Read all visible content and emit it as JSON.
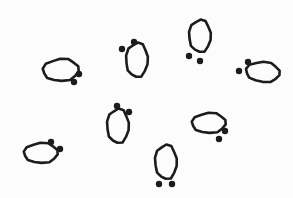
{
  "canvas": {
    "width": 293,
    "height": 198,
    "background_color": "#fcfcfc",
    "ink_color": "#1c1c1c",
    "stroke_width": 2.6,
    "description": "Line drawing of eight footprint-like glyphs scattered on a blank background"
  },
  "glyphs": [
    {
      "id": "glyph-1",
      "name": "footprint-upper-left",
      "orientation": "horizontal",
      "oval": {
        "cx": 61,
        "cy": 70,
        "rx": 18,
        "ry": 11,
        "rotation": -4
      },
      "dots": [
        {
          "cx": 79,
          "cy": 74,
          "r": 3.2
        },
        {
          "cx": 74,
          "cy": 82,
          "r": 3.2
        }
      ],
      "dot_placement": "lower-right"
    },
    {
      "id": "glyph-2",
      "name": "footprint-top-center-left",
      "orientation": "vertical",
      "oval": {
        "cx": 137,
        "cy": 60,
        "rx": 11,
        "ry": 17,
        "rotation": 3
      },
      "dots": [
        {
          "cx": 134,
          "cy": 42,
          "r": 3.2
        },
        {
          "cx": 122,
          "cy": 49,
          "r": 3.2
        }
      ],
      "dot_placement": "upper-left"
    },
    {
      "id": "glyph-3",
      "name": "footprint-top-right",
      "orientation": "vertical",
      "oval": {
        "cx": 200,
        "cy": 36,
        "rx": 11,
        "ry": 16,
        "rotation": 2
      },
      "dots": [
        {
          "cx": 189,
          "cy": 56,
          "r": 3.2
        },
        {
          "cx": 200,
          "cy": 61,
          "r": 3.2
        }
      ],
      "dot_placement": "below-left"
    },
    {
      "id": "glyph-4",
      "name": "footprint-right",
      "orientation": "horizontal",
      "oval": {
        "cx": 263,
        "cy": 72,
        "rx": 17,
        "ry": 10,
        "rotation": 3
      },
      "dots": [
        {
          "cx": 248,
          "cy": 62,
          "r": 3.2
        },
        {
          "cx": 239,
          "cy": 71,
          "r": 3.2
        }
      ],
      "dot_placement": "upper-left"
    },
    {
      "id": "glyph-5",
      "name": "footprint-center",
      "orientation": "vertical",
      "oval": {
        "cx": 118,
        "cy": 126,
        "rx": 11,
        "ry": 17,
        "rotation": 2
      },
      "dots": [
        {
          "cx": 117,
          "cy": 106,
          "r": 3.2
        },
        {
          "cx": 129,
          "cy": 112,
          "r": 3.2
        }
      ],
      "dot_placement": "above-right"
    },
    {
      "id": "glyph-6",
      "name": "footprint-lower-left",
      "orientation": "horizontal",
      "oval": {
        "cx": 41,
        "cy": 153,
        "rx": 17,
        "ry": 10,
        "rotation": -3
      },
      "dots": [
        {
          "cx": 51,
          "cy": 142,
          "r": 3.2
        },
        {
          "cx": 60,
          "cy": 149,
          "r": 3.2
        }
      ],
      "dot_placement": "upper-right"
    },
    {
      "id": "glyph-7",
      "name": "footprint-middle-right",
      "orientation": "horizontal",
      "oval": {
        "cx": 209,
        "cy": 123,
        "rx": 17,
        "ry": 10,
        "rotation": -3
      },
      "dots": [
        {
          "cx": 225,
          "cy": 131,
          "r": 3.2
        },
        {
          "cx": 219,
          "cy": 139,
          "r": 3.2
        }
      ],
      "dot_placement": "lower-right"
    },
    {
      "id": "glyph-8",
      "name": "footprint-bottom-center",
      "orientation": "vertical",
      "oval": {
        "cx": 166,
        "cy": 162,
        "rx": 11,
        "ry": 17,
        "rotation": 1
      },
      "dots": [
        {
          "cx": 159,
          "cy": 184,
          "r": 3.2
        },
        {
          "cx": 172,
          "cy": 184,
          "r": 3.2
        }
      ],
      "dot_placement": "below"
    }
  ]
}
